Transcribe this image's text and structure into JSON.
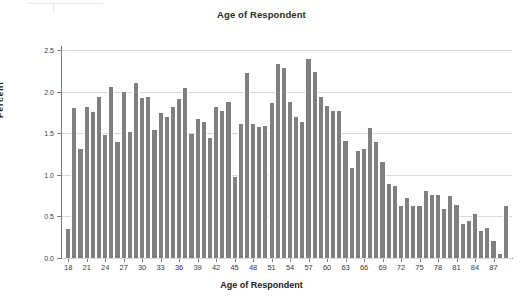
{
  "chart_data": {
    "type": "bar",
    "title": "Age of Respondent",
    "xlabel": "Age of Respondent",
    "ylabel": "Percent",
    "ylim": [
      0.0,
      2.5
    ],
    "xlim": [
      17,
      90
    ],
    "grid": true,
    "legend": null,
    "bar_color": "#808080",
    "gridline_color": "#d9d9d9",
    "axis_color": "#7a7a7a",
    "ytick_labels": [
      "0.0",
      "0.5",
      "1.0",
      "1.5",
      "2.0",
      "2.5"
    ],
    "ytick_values": [
      0.0,
      0.5,
      1.0,
      1.5,
      2.0,
      2.5
    ],
    "xtick_labels": [
      "18",
      "21",
      "24",
      "27",
      "30",
      "33",
      "36",
      "39",
      "42",
      "45",
      "48",
      "51",
      "54",
      "57",
      "60",
      "63",
      "66",
      "69",
      "72",
      "75",
      "78",
      "81",
      "84",
      "87"
    ],
    "xtick_values": [
      18,
      21,
      24,
      27,
      30,
      33,
      36,
      39,
      42,
      45,
      48,
      51,
      54,
      57,
      60,
      63,
      66,
      69,
      72,
      75,
      78,
      81,
      84,
      87
    ],
    "categories": [
      18,
      19,
      20,
      21,
      22,
      23,
      24,
      25,
      26,
      27,
      28,
      29,
      30,
      31,
      32,
      33,
      34,
      35,
      36,
      37,
      38,
      39,
      40,
      41,
      42,
      43,
      44,
      45,
      46,
      47,
      48,
      49,
      50,
      51,
      52,
      53,
      54,
      55,
      56,
      57,
      58,
      59,
      60,
      61,
      62,
      63,
      64,
      65,
      66,
      67,
      68,
      69,
      70,
      71,
      72,
      73,
      74,
      75,
      76,
      77,
      78,
      79,
      80,
      81,
      82,
      83,
      84,
      85,
      86,
      87,
      88,
      89
    ],
    "values": [
      0.35,
      1.8,
      1.31,
      1.81,
      1.75,
      1.93,
      1.48,
      2.05,
      1.4,
      2.0,
      1.51,
      2.1,
      1.92,
      1.94,
      1.54,
      1.74,
      1.69,
      1.82,
      1.91,
      2.04,
      1.49,
      1.67,
      1.64,
      1.44,
      1.81,
      1.77,
      1.87,
      0.97,
      1.61,
      2.22,
      1.61,
      1.58,
      1.59,
      1.86,
      2.33,
      2.28,
      1.87,
      1.69,
      1.63,
      2.39,
      2.24,
      1.94,
      1.83,
      1.77,
      1.77,
      1.41,
      1.08,
      1.29,
      1.31,
      1.56,
      1.39,
      1.15,
      0.89,
      0.86,
      0.63,
      0.72,
      0.62,
      0.62,
      0.8,
      0.76,
      0.76,
      0.59,
      0.74,
      0.64,
      0.41,
      0.44,
      0.53,
      0.32,
      0.36,
      0.21,
      0.05,
      0.63
    ]
  }
}
